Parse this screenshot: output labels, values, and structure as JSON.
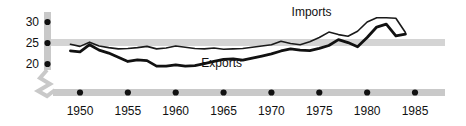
{
  "chart_data": {
    "type": "line",
    "title": "",
    "subtitle": "",
    "xlabel": "",
    "ylabel": "",
    "xlim": [
      1949,
      1985.6
    ],
    "ylim": [
      18.2,
      32.0
    ],
    "grid": false,
    "legend_position": "inline-annotations",
    "axis_break": true,
    "axis_break_note": "y-axis broken below 20",
    "reference_band": {
      "value": 25,
      "color": "#d4d4d4"
    },
    "yticks": [
      20,
      25,
      30
    ],
    "ytick_labels": [
      "20",
      "25",
      "30"
    ],
    "xticks": [
      1950,
      1955,
      1960,
      1965,
      1970,
      1975,
      1980,
      1985
    ],
    "xtick_labels": [
      "1950",
      "1955",
      "1960",
      "1965",
      "1970",
      "1975",
      "1980",
      "1985"
    ],
    "x": [
      1949,
      1950,
      1951,
      1952,
      1953,
      1954,
      1955,
      1956,
      1957,
      1958,
      1959,
      1960,
      1961,
      1962,
      1963,
      1964,
      1965,
      1966,
      1967,
      1968,
      1969,
      1970,
      1971,
      1972,
      1973,
      1974,
      1975,
      1976,
      1977,
      1978,
      1979,
      1980,
      1981,
      1982,
      1983,
      1984
    ],
    "series": [
      {
        "name": "Imports",
        "color": "#1a1a1a",
        "line_width": 1.6,
        "label_x": 1974.2,
        "label_y": 31.4,
        "values": [
          24.7,
          24.2,
          25.2,
          24.3,
          23.9,
          23.6,
          23.7,
          23.9,
          24.2,
          23.6,
          23.8,
          24.3,
          24.0,
          23.7,
          23.6,
          23.8,
          23.5,
          23.6,
          23.7,
          24.0,
          24.3,
          24.6,
          25.4,
          24.9,
          24.6,
          25.3,
          26.3,
          27.6,
          27.0,
          26.6,
          27.8,
          30.0,
          31.0,
          31.0,
          30.9,
          27.5
        ]
      },
      {
        "name": "Exports",
        "color": "#111111",
        "line_width": 2.8,
        "label_x": 1964.8,
        "label_y": 19.4,
        "values": [
          23.1,
          22.9,
          24.6,
          23.3,
          22.6,
          21.6,
          20.6,
          21.0,
          20.8,
          19.5,
          19.5,
          19.8,
          19.5,
          19.6,
          20.1,
          20.6,
          21.1,
          21.2,
          20.9,
          21.4,
          21.9,
          22.4,
          23.1,
          23.6,
          23.3,
          23.2,
          23.7,
          24.4,
          25.8,
          25.1,
          24.1,
          26.3,
          28.8,
          29.5,
          26.7,
          27.1
        ]
      }
    ],
    "annotations": [
      {
        "name": "imports-label",
        "text": "Imports"
      },
      {
        "name": "exports-label",
        "text": "Exports"
      }
    ]
  },
  "axes": {
    "y_axis_name": "value-axis",
    "x_axis_name": "year-axis",
    "band_color": "#c9c9c9",
    "tick_dot_color": "#111111"
  }
}
